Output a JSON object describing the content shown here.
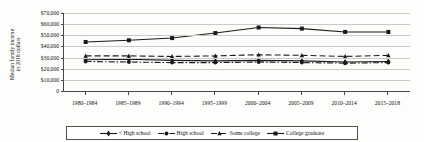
{
  "chart_data": {
    "type": "line",
    "title": "",
    "xlabel": "",
    "ylabel": "Median family income in 2018 dollars",
    "ylabel_line1": "Median family income",
    "ylabel_line2": "in 2018 dollars",
    "categories": [
      "1980–1984",
      "1985–1989",
      "1990–1994",
      "1995–1999",
      "2000–2004",
      "2005–2009",
      "2010–2014",
      "2015–2018"
    ],
    "ylim": [
      0,
      70000
    ],
    "ytick_labels": [
      "$70,000",
      "$60,000",
      "$50,000",
      "$40,000",
      "$30,000",
      "$20,000",
      "$10,000",
      "0"
    ],
    "ytick_values": [
      70000,
      60000,
      50000,
      40000,
      30000,
      20000,
      10000,
      0
    ],
    "grid": true,
    "legend_position": "bottom",
    "series": [
      {
        "name": "< High school",
        "marker": "diamond",
        "dash": "solid",
        "values": [
          28000,
          28500,
          27500,
          27000,
          27500,
          27000,
          26000,
          26500
        ]
      },
      {
        "name": "High school",
        "marker": "circle",
        "dash": "dashdot",
        "values": [
          26500,
          26000,
          25500,
          25500,
          26000,
          25500,
          25000,
          25500
        ]
      },
      {
        "name": "Some college",
        "marker": "triangle",
        "dash": "dashed",
        "values": [
          31500,
          31500,
          31000,
          31500,
          32500,
          32000,
          31000,
          32000
        ]
      },
      {
        "name": "College graduate",
        "marker": "square",
        "dash": "solid",
        "values": [
          44000,
          45500,
          47500,
          52000,
          57000,
          56000,
          53000,
          53000
        ]
      }
    ]
  },
  "colors": {
    "line": "#1a1a1a",
    "grid": "#c9c9c6",
    "axis": "#4a4a4a",
    "background": "#fdfdfb"
  }
}
